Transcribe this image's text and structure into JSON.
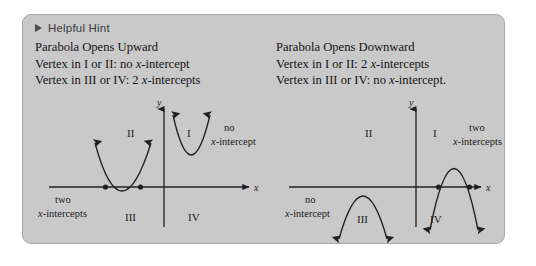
{
  "panel": {
    "hint": {
      "icon": "triangle-right-icon",
      "label": "Helpful Hint"
    },
    "background_color": "#c9c9c9",
    "border_color": "#a8a8a8"
  },
  "columns": [
    {
      "id": "upward",
      "heading": "Parabola Opens Upward",
      "lines": [
        {
          "prefix": "Vertex in I or II: no ",
          "italic": "x",
          "suffix": "-intercept"
        },
        {
          "prefix": "Vertex in III or IV: 2 ",
          "italic": "x",
          "suffix": "-intercepts"
        }
      ]
    },
    {
      "id": "downward",
      "heading": "Parabola Opens Downward",
      "lines": [
        {
          "prefix": "Vertex in I or II: 2 ",
          "italic": "x",
          "suffix": "-intercepts"
        },
        {
          "prefix": "Vertex in III or IV: no ",
          "italic": "x",
          "suffix": "-intercept."
        }
      ]
    }
  ],
  "graphs": [
    {
      "id": "opens-upward",
      "axis_labels": {
        "x": "x",
        "y": "y"
      },
      "quadrants": [
        "I",
        "II",
        "III",
        "IV"
      ],
      "annotations": [
        {
          "id": "two-intercepts",
          "line1": "two",
          "line2_italic": "x",
          "line2_rest": "-intercepts"
        },
        {
          "id": "no-intercept",
          "line1": "no",
          "line2_italic": "x",
          "line2_rest": "-intercept"
        }
      ]
    },
    {
      "id": "opens-downward",
      "axis_labels": {
        "x": "x",
        "y": "y"
      },
      "quadrants": [
        "I",
        "II",
        "III",
        "IV"
      ],
      "annotations": [
        {
          "id": "two-intercepts",
          "line1": "two",
          "line2_italic": "x",
          "line2_rest": "-intercepts"
        },
        {
          "id": "no-intercept",
          "line1": "no",
          "line2_italic": "x",
          "line2_rest": "-intercept"
        }
      ]
    }
  ]
}
